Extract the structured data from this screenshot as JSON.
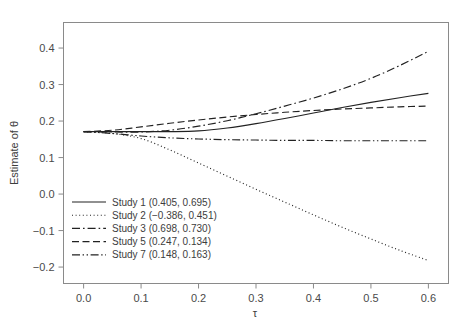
{
  "chart_data": {
    "type": "line",
    "title": "",
    "subtitle": "",
    "xlabel": "τ",
    "ylabel": "Estimate of θ",
    "xlim": [
      -0.035,
      0.635
    ],
    "ylim": [
      -0.245,
      0.47
    ],
    "grid": false,
    "legend_position": "bottom-left",
    "xticks": [
      0.0,
      0.1,
      0.2,
      0.3,
      0.4,
      0.5,
      0.6
    ],
    "xtick_labels": [
      "0.0",
      "0.1",
      "0.2",
      "0.3",
      "0.4",
      "0.5",
      "0.6"
    ],
    "yticks": [
      -0.2,
      -0.1,
      0.0,
      0.1,
      0.2,
      0.3,
      0.4
    ],
    "ytick_labels": [
      "−0.2",
      "−0.1",
      "0.0",
      "0.1",
      "0.2",
      "0.3",
      "0.4"
    ],
    "x": [
      0.0,
      0.05,
      0.1,
      0.15,
      0.2,
      0.25,
      0.3,
      0.35,
      0.4,
      0.45,
      0.5,
      0.55,
      0.6
    ],
    "series": [
      {
        "name": "Study 1",
        "label": "Study 1 (0.405, 0.695)",
        "values_label": "(0.405, 0.695)",
        "dash": "solid",
        "color": "#222222",
        "values": [
          0.171,
          0.171,
          0.171,
          0.171,
          0.173,
          0.181,
          0.193,
          0.207,
          0.222,
          0.237,
          0.251,
          0.264,
          0.276
        ]
      },
      {
        "name": "Study 2",
        "label": "Study 2 (−0.386, 0.451)",
        "values_label": "(−0.386, 0.451)",
        "dash": "dotted",
        "color": "#222222",
        "values": [
          0.171,
          0.166,
          0.152,
          0.121,
          0.085,
          0.049,
          0.013,
          -0.022,
          -0.057,
          -0.091,
          -0.123,
          -0.154,
          -0.182
        ]
      },
      {
        "name": "Study 3",
        "label": "Study 3 (0.698, 0.730)",
        "values_label": "(0.698, 0.730)",
        "dash": "dashdot",
        "color": "#222222",
        "values": [
          0.171,
          0.17,
          0.17,
          0.175,
          0.186,
          0.201,
          0.22,
          0.241,
          0.263,
          0.288,
          0.317,
          0.352,
          0.391
        ]
      },
      {
        "name": "Study 5",
        "label": "Study 5 (0.247, 0.134)",
        "values_label": "(0.247, 0.134)",
        "dash": "dashed",
        "color": "#222222",
        "values": [
          0.171,
          0.175,
          0.184,
          0.194,
          0.203,
          0.211,
          0.218,
          0.224,
          0.229,
          0.233,
          0.236,
          0.239,
          0.241
        ]
      },
      {
        "name": "Study 7",
        "label": "Study 7 (0.148, 0.163)",
        "values_label": "(0.148, 0.163)",
        "dash": "dashdotdot",
        "color": "#222222",
        "values": [
          0.171,
          0.166,
          0.159,
          0.154,
          0.151,
          0.149,
          0.148,
          0.147,
          0.147,
          0.146,
          0.146,
          0.146,
          0.146
        ]
      }
    ]
  },
  "axes": {
    "x_label": "τ",
    "y_label": "Estimate of θ"
  },
  "legend": {
    "entries": [
      {
        "label": "Study 1 (0.405, 0.695)"
      },
      {
        "label": "Study 2 (−0.386, 0.451)"
      },
      {
        "label": "Study 3 (0.698, 0.730)"
      },
      {
        "label": "Study 5 (0.247, 0.134)"
      },
      {
        "label": "Study 7 (0.148, 0.163)"
      }
    ]
  }
}
